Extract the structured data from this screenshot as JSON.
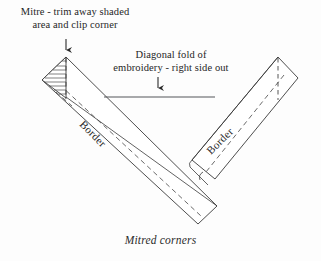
{
  "figure": {
    "caption": "Mitred corners",
    "annotations": [
      {
        "id": "mitre-note",
        "line1": "Mitre - trim away shaded",
        "line2": "area and clip corner",
        "text": "Mitre - trim away shaded\narea and clip corner",
        "arrow": "down-arrow-icon"
      },
      {
        "id": "fold-note",
        "line1": "Diagonal fold of",
        "line2": "embroidery - right side out",
        "text": "Diagonal fold of\nembroidery - right side out",
        "arrow": "down-arrow-icon"
      }
    ],
    "labels": {
      "border_left": "Border",
      "border_right": "Border"
    },
    "colors": {
      "background": "#fdfdfd",
      "line": "#3a3a3a",
      "hatch": "#4a4a4a",
      "dashed": "#454545",
      "text": "#262626"
    },
    "geometry": {
      "left_strip": {
        "outer": [
          [
            66,
            57
          ],
          [
            215,
            205
          ],
          [
            196,
            222
          ],
          [
            42,
            80
          ]
        ],
        "fold_line": [
          [
            66,
            97
          ],
          [
            215,
            205
          ]
        ],
        "dashed_seam": [
          [
            60,
            84
          ],
          [
            199,
            214
          ]
        ]
      },
      "right_strip": {
        "outer": [
          [
            278,
            57
          ],
          [
            297,
            77
          ],
          [
            214,
            178
          ],
          [
            191,
            160
          ]
        ],
        "fold_line": [
          [
            278,
            57
          ],
          [
            191,
            160
          ]
        ],
        "dashed_seam": [
          [
            282,
            73
          ],
          [
            205,
            172
          ]
        ]
      },
      "hatched_triangle": {
        "points": [
          [
            66,
            57
          ],
          [
            42,
            80
          ],
          [
            66,
            97
          ]
        ],
        "hatch_lines": 9
      },
      "diagonal_fold_line": [
        [
          104,
          97
        ],
        [
          215,
          97
        ]
      ],
      "dashed_vertical_left": [
        [
          66,
          57
        ],
        [
          66,
          100
        ]
      ],
      "dashed_vertical_right": [
        [
          278,
          57
        ],
        [
          278,
          100
        ]
      ],
      "arrows": [
        {
          "x": 66,
          "y_start": 39,
          "y_end": 55
        },
        {
          "x": 158,
          "y_start": 77,
          "y_end": 93
        }
      ]
    }
  }
}
